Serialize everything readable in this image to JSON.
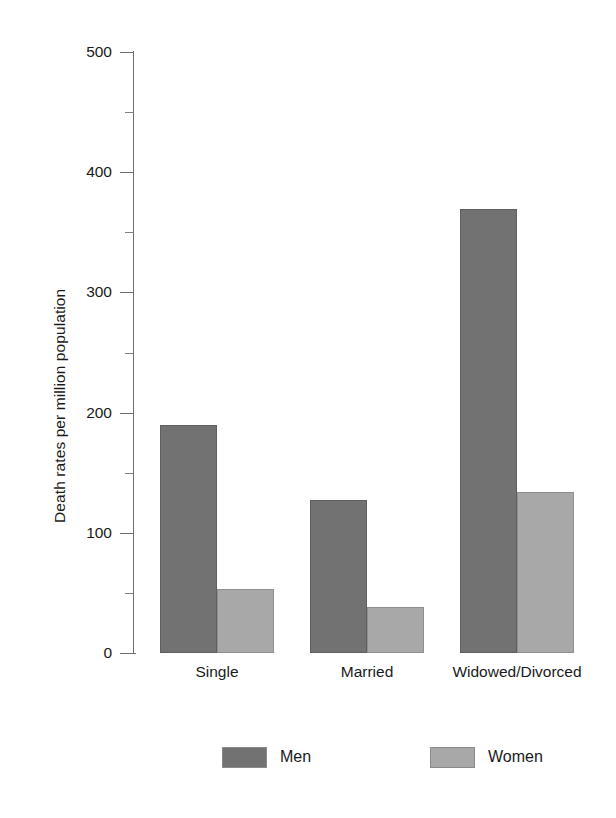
{
  "chart_data": {
    "type": "bar",
    "title": "",
    "xlabel": "",
    "ylabel": "Death rates per million population",
    "categories": [
      "Single",
      "Married",
      "Widowed/Divorced"
    ],
    "series": [
      {
        "name": "Men",
        "color": "#727272",
        "values": [
          190,
          127,
          369
        ]
      },
      {
        "name": "Women",
        "color": "#a8a8a8",
        "values": [
          53,
          38,
          134
        ]
      }
    ],
    "ylim": [
      0,
      500
    ],
    "ytick_labels": [
      "0",
      "100",
      "200",
      "300",
      "400",
      "500"
    ],
    "ytick_values": [
      0,
      100,
      200,
      300,
      400,
      500
    ],
    "yminor_values": [
      50,
      150,
      250,
      350,
      450
    ],
    "grid": false,
    "legend_position": "bottom",
    "bar_grouping": "adjacent-pairs"
  }
}
